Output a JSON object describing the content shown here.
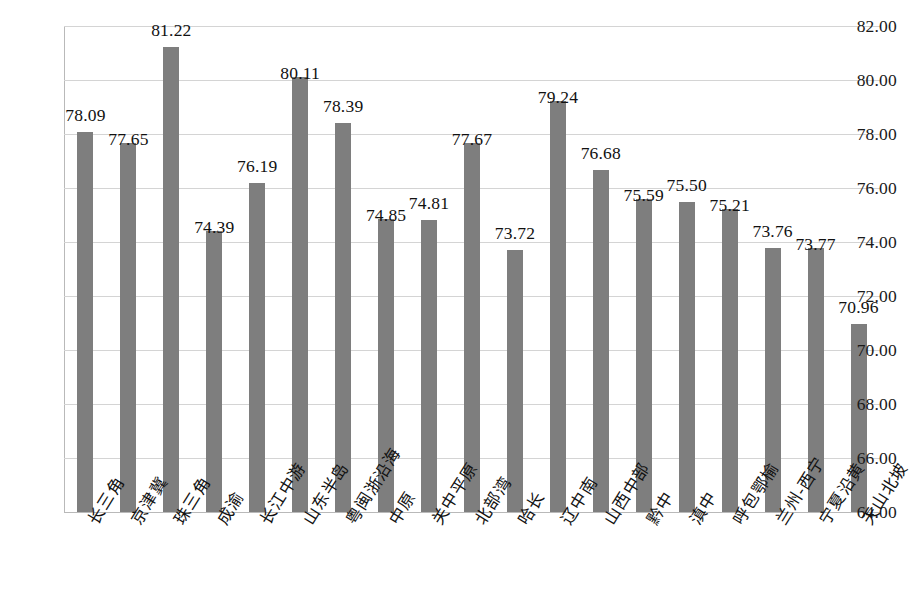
{
  "chart_data": {
    "type": "bar",
    "title": "",
    "subtitle": "",
    "xlabel": "",
    "ylabel": "",
    "ylim": [
      64.0,
      82.0
    ],
    "ytick_step": 2.0,
    "ytick_labels": [
      "82.00",
      "80.00",
      "78.00",
      "76.00",
      "74.00",
      "72.00",
      "70.00",
      "68.00",
      "66.00",
      "64.00"
    ],
    "ytick_values": [
      82.0,
      80.0,
      78.0,
      76.0,
      74.0,
      72.0,
      70.0,
      68.0,
      66.0,
      64.0
    ],
    "grid": true,
    "legend": false,
    "legend_position": "none",
    "bar_color": "#7e7e7e",
    "gridline_color": "#d4d4d4",
    "axis_color": "#b9b9b9",
    "categories": [
      "长三角",
      "京津冀",
      "珠三角",
      "成渝",
      "长江中游",
      "山东半岛",
      "粤闽浙沿海",
      "中原",
      "关中平原",
      "北部湾",
      "哈长",
      "辽中南",
      "山西中部",
      "黔中",
      "滇中",
      "呼包鄂榆",
      "兰州-西宁",
      "宁夏沿黄",
      "天山北坡"
    ],
    "values": [
      78.09,
      77.65,
      81.22,
      74.39,
      76.19,
      80.11,
      78.39,
      74.85,
      74.81,
      77.67,
      73.72,
      79.24,
      76.68,
      75.59,
      75.5,
      75.21,
      73.76,
      73.77,
      70.96
    ],
    "value_labels": [
      "78.09",
      "77.65",
      "81.22",
      "74.39",
      "76.19",
      "80.11",
      "78.39",
      "74.85",
      "74.81",
      "77.67",
      "73.72",
      "79.24",
      "76.68",
      "75.59",
      "75.50",
      "75.21",
      "73.76",
      "73.77",
      "70.96"
    ]
  }
}
